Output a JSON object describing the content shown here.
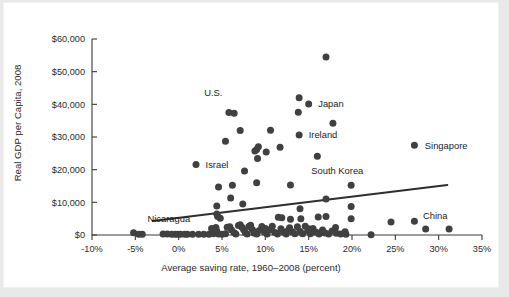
{
  "chart_data": {
    "type": "scatter",
    "title": "",
    "xlabel": "Average saving rate, 1960–2008 (percent)",
    "ylabel": "Real GDP per Capita, 2008",
    "xlim": [
      -10,
      35
    ],
    "ylim": [
      0,
      60000
    ],
    "grid": false,
    "legend": "none",
    "xticks": [
      "-10%",
      "-5%",
      "0%",
      "5%",
      "10%",
      "15%",
      "20%",
      "25%",
      "30%",
      "35%"
    ],
    "xtick_values": [
      -10,
      -5,
      0,
      5,
      10,
      15,
      20,
      25,
      30,
      35
    ],
    "yticks": [
      "$0",
      "$10,000",
      "$20,000",
      "$30,000",
      "$40,000",
      "$50,000",
      "$60,000"
    ],
    "ytick_values": [
      0,
      10000,
      20000,
      30000,
      40000,
      50000,
      60000
    ],
    "marker_color": "#404040",
    "trendline_color": "#2e2e2e",
    "axis_color": "#3b3b3b",
    "background_color": "#ffffff",
    "figure_background_color": "#e9e9e9",
    "trendline": {
      "x0": -3.0,
      "y0": 4300,
      "x1": 31.0,
      "y1": 15300
    },
    "annotations": [
      {
        "text": "U.S.",
        "x": 6.0,
        "y": 37500,
        "label_dx": -2,
        "label_dy": 5200,
        "has_marker_dot": false
      },
      {
        "text": "Japan",
        "x": 15.0,
        "y": 40100,
        "label_dx": 1.1,
        "label_dy": 0,
        "has_marker_dot": false
      },
      {
        "text": "Ireland",
        "x": 13.9,
        "y": 30600,
        "label_dx": 1.1,
        "label_dy": 0,
        "has_marker_dot": false
      },
      {
        "text": "Israel",
        "x": 2.0,
        "y": 21600,
        "label_dx": 1.1,
        "label_dy": 0,
        "has_marker_dot": false
      },
      {
        "text": "Singapore",
        "x": 27.2,
        "y": 27500,
        "label_dx": 1.2,
        "label_dy": 0,
        "has_marker_dot": false
      },
      {
        "text": "South Korea",
        "x": 19.9,
        "y": 15200,
        "label_dx": -1.6,
        "label_dy": 3400,
        "has_marker_dot": false
      },
      {
        "text": "Nicaragua",
        "x": -5.0,
        "y": 400,
        "label_dx": 1.4,
        "label_dy": 3500,
        "has_marker_dot": false
      },
      {
        "text": "China",
        "x": 31.2,
        "y": 1800,
        "label_dx": -1.6,
        "label_dy": 3200,
        "has_marker_dot": false
      }
    ],
    "points": [
      [
        17.0,
        54500
      ],
      [
        13.9,
        42000
      ],
      [
        15.0,
        40100
      ],
      [
        13.8,
        37600
      ],
      [
        5.8,
        37500
      ],
      [
        6.4,
        37300
      ],
      [
        17.8,
        34200
      ],
      [
        7.1,
        32000
      ],
      [
        10.6,
        32100
      ],
      [
        13.9,
        30600
      ],
      [
        5.4,
        28700
      ],
      [
        27.2,
        27500
      ],
      [
        9.2,
        27000
      ],
      [
        11.7,
        26900
      ],
      [
        9.0,
        26200
      ],
      [
        8.8,
        25700
      ],
      [
        10.1,
        25400
      ],
      [
        16.0,
        24100
      ],
      [
        9.1,
        23400
      ],
      [
        2.0,
        21600
      ],
      [
        7.6,
        19600
      ],
      [
        9.0,
        16000
      ],
      [
        19.9,
        15200
      ],
      [
        12.9,
        15300
      ],
      [
        6.2,
        15200
      ],
      [
        4.6,
        14700
      ],
      [
        6.0,
        11300
      ],
      [
        17.0,
        11000
      ],
      [
        19.9,
        8700
      ],
      [
        4.4,
        8900
      ],
      [
        7.4,
        9500
      ],
      [
        14.0,
        8000
      ],
      [
        4.4,
        6400
      ],
      [
        4.5,
        5700
      ],
      [
        4.8,
        5100
      ],
      [
        11.5,
        5400
      ],
      [
        11.9,
        5300
      ],
      [
        12.9,
        4800
      ],
      [
        16.1,
        5500
      ],
      [
        17.0,
        5700
      ],
      [
        19.9,
        5000
      ],
      [
        14.1,
        5000
      ],
      [
        18.1,
        2300
      ],
      [
        19.2,
        1000
      ],
      [
        24.5,
        4000
      ],
      [
        27.2,
        4200
      ],
      [
        28.5,
        1800
      ],
      [
        31.2,
        1800
      ],
      [
        22.2,
        100
      ],
      [
        -5.2,
        700
      ],
      [
        -4.6,
        200
      ],
      [
        -4.2,
        200
      ],
      [
        -1.8,
        300
      ],
      [
        -1.3,
        300
      ],
      [
        -0.8,
        250
      ],
      [
        -0.4,
        250
      ],
      [
        0.2,
        250
      ],
      [
        1.0,
        200
      ],
      [
        1.6,
        200
      ],
      [
        3.5,
        200
      ],
      [
        4.0,
        400
      ],
      [
        4.1,
        1600
      ],
      [
        4.3,
        2300
      ],
      [
        4.4,
        1200
      ],
      [
        4.6,
        300
      ],
      [
        5.0,
        200
      ],
      [
        5.4,
        400
      ],
      [
        5.6,
        2400
      ],
      [
        5.9,
        2500
      ],
      [
        6.1,
        1500
      ],
      [
        6.4,
        700
      ],
      [
        6.6,
        300
      ],
      [
        6.9,
        2900
      ],
      [
        7.1,
        3100
      ],
      [
        7.3,
        2400
      ],
      [
        7.5,
        1600
      ],
      [
        7.7,
        700
      ],
      [
        7.9,
        300
      ],
      [
        8.1,
        2600
      ],
      [
        8.3,
        3000
      ],
      [
        8.5,
        1700
      ],
      [
        8.7,
        600
      ],
      [
        9.0,
        300
      ],
      [
        9.3,
        1400
      ],
      [
        9.6,
        2600
      ],
      [
        9.9,
        900
      ],
      [
        10.2,
        300
      ],
      [
        10.5,
        1500
      ],
      [
        10.8,
        2700
      ],
      [
        11.1,
        800
      ],
      [
        11.4,
        300
      ],
      [
        11.8,
        1900
      ],
      [
        12.1,
        900
      ],
      [
        12.4,
        300
      ],
      [
        12.8,
        2200
      ],
      [
        13.1,
        1000
      ],
      [
        13.4,
        400
      ],
      [
        13.7,
        2500
      ],
      [
        14.0,
        1100
      ],
      [
        14.3,
        400
      ],
      [
        14.6,
        2700
      ],
      [
        14.9,
        1300
      ],
      [
        15.2,
        400
      ],
      [
        15.5,
        2000
      ],
      [
        15.8,
        900
      ],
      [
        16.2,
        300
      ],
      [
        16.6,
        1500
      ],
      [
        16.9,
        600
      ],
      [
        17.3,
        300
      ],
      [
        17.7,
        1200
      ],
      [
        18.2,
        500
      ],
      [
        18.7,
        300
      ],
      [
        19.3,
        200
      ],
      [
        3.8,
        2000
      ],
      [
        8.9,
        800
      ],
      [
        10.0,
        2000
      ],
      [
        12.6,
        1300
      ],
      [
        15.0,
        1900
      ],
      [
        16.4,
        800
      ],
      [
        2.9,
        250
      ],
      [
        2.3,
        250
      ],
      [
        -0.1,
        250
      ],
      [
        0.7,
        250
      ]
    ]
  }
}
